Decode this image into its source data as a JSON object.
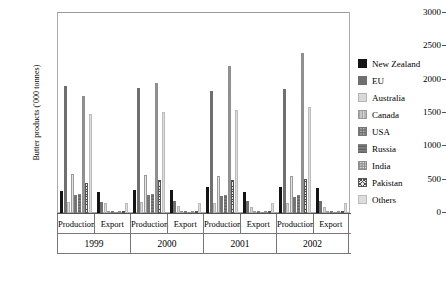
{
  "chart_data": {
    "type": "bar",
    "title": "",
    "xlabel": "",
    "ylabel": "Butter products ('000 tonnes)",
    "ylim": [
      0,
      3000
    ],
    "ytick_step": 500,
    "ytick_labels": [
      "0",
      "500",
      "1000",
      "1500",
      "2000",
      "2500",
      "3000"
    ],
    "grid": false,
    "legend_position": "right",
    "years": [
      "1999",
      "2000",
      "2001",
      "2002"
    ],
    "measures": [
      "Production",
      "Export"
    ],
    "categories": [
      "1999 Production",
      "1999 Export",
      "2000 Production",
      "2000 Export",
      "2001 Production",
      "2001 Export",
      "2002 Production",
      "2002 Export"
    ],
    "series": [
      {
        "name": "New Zealand",
        "pattern": "solid-black",
        "values": [
          325,
          310,
          340,
          345,
          385,
          320,
          390,
          375
        ]
      },
      {
        "name": "EU",
        "pattern": "solid-dark-gray",
        "values": [
          1900,
          165,
          1880,
          175,
          1825,
          180,
          1860,
          175
        ]
      },
      {
        "name": "Australia",
        "pattern": "solid-light-gray",
        "values": [
          165,
          150,
          170,
          105,
          155,
          95,
          150,
          85
        ]
      },
      {
        "name": "Canada",
        "pattern": "vertical-lines",
        "values": [
          580,
          15,
          565,
          12,
          555,
          10,
          560,
          10
        ]
      },
      {
        "name": "USA",
        "pattern": "fine-grid",
        "values": [
          265,
          15,
          270,
          10,
          255,
          10,
          245,
          10
        ]
      },
      {
        "name": "Russia",
        "pattern": "horizontal-lines",
        "values": [
          280,
          10,
          285,
          8,
          275,
          8,
          270,
          8
        ]
      },
      {
        "name": "India",
        "pattern": "open-grid",
        "values": [
          1750,
          5,
          1950,
          5,
          2200,
          5,
          2400,
          5
        ]
      },
      {
        "name": "Pakistan",
        "pattern": "cross-hatch",
        "values": [
          455,
          5,
          490,
          5,
          495,
          5,
          505,
          5
        ]
      },
      {
        "name": "Others",
        "pattern": "pale-gray",
        "values": [
          1490,
          150,
          1520,
          150,
          1545,
          150,
          1590,
          145
        ]
      }
    ]
  },
  "legend": {
    "items": [
      {
        "label": "New Zealand"
      },
      {
        "label": "EU"
      },
      {
        "label": "Australia"
      },
      {
        "label": "Canada"
      },
      {
        "label": "USA"
      },
      {
        "label": "Russia"
      },
      {
        "label": "India"
      },
      {
        "label": "Pakistan"
      },
      {
        "label": "Others"
      }
    ]
  }
}
